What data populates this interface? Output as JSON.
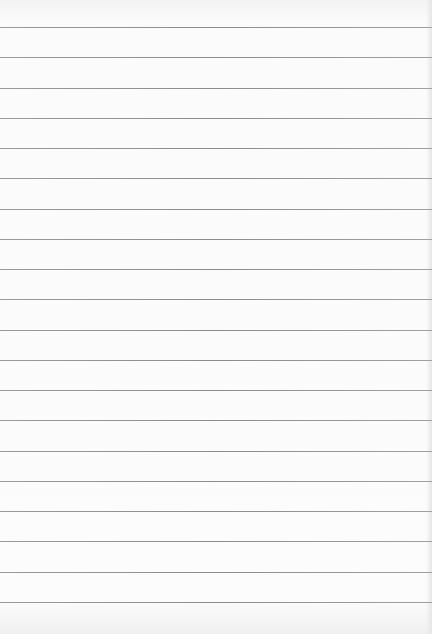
{
  "image": {
    "description": "Blank lined notebook paper",
    "background_color": "#fbfbfb",
    "line_color": "#919191",
    "line_count": 20,
    "first_line_y": 27,
    "line_spacing": 30.26
  }
}
